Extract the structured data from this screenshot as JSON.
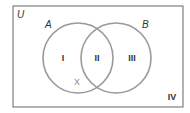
{
  "diagram": {
    "type": "venn",
    "universe_label": "U",
    "sets": [
      {
        "label": "A"
      },
      {
        "label": "B"
      }
    ],
    "regions": [
      {
        "id": "I",
        "label": "I",
        "description": "A only"
      },
      {
        "id": "II",
        "label": "II",
        "description": "A and B"
      },
      {
        "id": "III",
        "label": "III",
        "description": "B only"
      },
      {
        "id": "IV",
        "label": "IV",
        "description": "outside A and B"
      }
    ],
    "marker": {
      "label": "X",
      "location": "region I, lower part near boundary with B"
    },
    "colors": {
      "outline": "#555555",
      "circle": "#8f8f8f",
      "text": "#333333",
      "marker": "#8a8a8a"
    }
  }
}
